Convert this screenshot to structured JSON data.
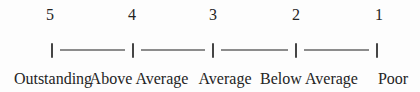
{
  "figure": {
    "points": [
      {
        "score": "5",
        "label": "Outstanding"
      },
      {
        "score": "4",
        "label": "Above Average"
      },
      {
        "score": "3",
        "label": "Average"
      },
      {
        "score": "2",
        "label": "Below Average"
      },
      {
        "score": "1",
        "label": "Poor"
      }
    ],
    "colors": {
      "background": "#fdfdfd",
      "text": "#242424",
      "tick": "#454545",
      "line": "#8c8c8c"
    }
  }
}
